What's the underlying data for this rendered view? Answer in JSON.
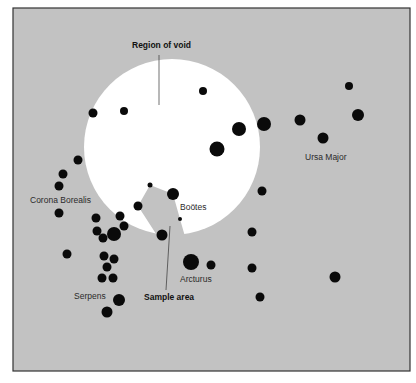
{
  "figure": {
    "panel": {
      "x": 13,
      "y": 8,
      "width": 397,
      "height": 363,
      "fill": "#c2c2c2",
      "border": "#333333"
    },
    "void_region": {
      "cx": 172,
      "cy": 147,
      "r": 88,
      "fill": "#ffffff",
      "sample_wedge": [
        [
          150,
          185
        ],
        [
          173,
          194
        ],
        [
          180,
          219
        ],
        [
          186,
          240
        ],
        [
          160,
          240
        ],
        [
          138,
          206
        ]
      ]
    },
    "star_color": "#0a0a0a",
    "stars": [
      [
        203,
        91,
        4
      ],
      [
        124,
        111,
        4
      ],
      [
        93,
        113,
        4.5
      ],
      [
        239,
        129,
        7
      ],
      [
        264,
        124,
        7
      ],
      [
        300,
        120,
        5.5
      ],
      [
        349,
        86,
        4
      ],
      [
        358,
        115,
        6
      ],
      [
        323,
        138,
        5.5
      ],
      [
        217,
        149,
        7.5
      ],
      [
        78,
        160,
        4.5
      ],
      [
        63,
        174,
        4.5
      ],
      [
        59,
        186,
        4.5
      ],
      [
        59,
        213,
        4.5
      ],
      [
        262,
        191,
        4.5
      ],
      [
        150,
        185,
        2.5
      ],
      [
        173,
        194,
        6
      ],
      [
        138,
        206,
        4.5
      ],
      [
        180,
        219,
        2
      ],
      [
        96,
        218,
        4.5
      ],
      [
        120,
        216,
        4.5
      ],
      [
        97,
        231,
        4.5
      ],
      [
        124,
        226,
        4.5
      ],
      [
        114,
        234,
        7
      ],
      [
        103,
        238,
        4.5
      ],
      [
        162,
        235,
        5.5
      ],
      [
        67,
        254,
        4.5
      ],
      [
        104,
        256,
        4.5
      ],
      [
        114,
        259,
        4.5
      ],
      [
        107,
        267,
        4.5
      ],
      [
        191,
        262,
        8
      ],
      [
        211,
        265,
        4.5
      ],
      [
        252,
        232,
        4.5
      ],
      [
        252,
        268,
        4.5
      ],
      [
        335,
        277,
        5.5
      ],
      [
        102,
        278,
        4.5
      ],
      [
        113,
        278,
        4.5
      ],
      [
        119,
        300,
        6
      ],
      [
        107,
        312,
        5.5
      ],
      [
        260,
        297,
        4.5
      ]
    ],
    "labels": {
      "region_of_void": "Region of void",
      "ursa_major": "Ursa Major",
      "corona_borealis": "Corona Borealis",
      "bootes": "Boötes",
      "arcturus": "Arcturus",
      "serpens": "Serpens",
      "sample_area": "Sample area"
    },
    "leader_lines": {
      "region_of_void": [
        159,
        55,
        159,
        105
      ],
      "sample_area": [
        170,
        226,
        166,
        290
      ]
    }
  }
}
